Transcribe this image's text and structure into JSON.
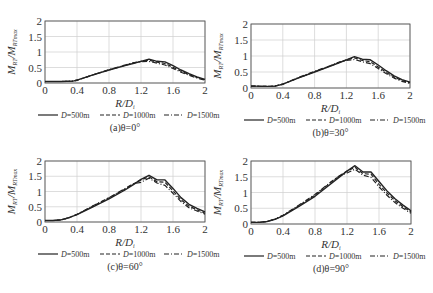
{
  "figure": {
    "x_axis_label_main": "R/D",
    "x_axis_label_sub": "i",
    "y_axis_label_main": "M",
    "y_axis_label_sub1": "RT",
    "y_axis_label_mid": "/M",
    "y_axis_label_sub2": "RTmax",
    "legend": [
      {
        "label": "D=500m",
        "style": "solid"
      },
      {
        "label": "D=1000m",
        "style": "dashed"
      },
      {
        "label": "D=1500m",
        "style": "dashdot"
      }
    ]
  },
  "chart_data": [
    {
      "type": "line",
      "title": "(a)θ=0°",
      "xlabel": "R/Di",
      "ylabel": "MRT/MRTmax",
      "xlim": [
        0,
        2
      ],
      "ylim": [
        0,
        2
      ],
      "xticks": [
        "0",
        "0.4",
        "0.8",
        "1.2",
        "1.6",
        "2"
      ],
      "yticks": [
        "0",
        "0.5",
        "1",
        "1.5",
        "2"
      ],
      "grid": true,
      "legend_position": "bottom",
      "x": [
        0,
        0.2,
        0.35,
        0.4,
        0.6,
        0.8,
        1.0,
        1.1,
        1.2,
        1.3,
        1.4,
        1.5,
        1.6,
        1.7,
        1.8,
        1.9,
        2.0
      ],
      "series": [
        {
          "name": "D=500m",
          "values": [
            0.05,
            0.05,
            0.06,
            0.09,
            0.26,
            0.42,
            0.56,
            0.63,
            0.7,
            0.77,
            0.7,
            0.68,
            0.56,
            0.42,
            0.3,
            0.2,
            0.12
          ]
        },
        {
          "name": "D=1000m",
          "values": [
            0.05,
            0.05,
            0.06,
            0.09,
            0.26,
            0.42,
            0.57,
            0.64,
            0.7,
            0.74,
            0.67,
            0.63,
            0.51,
            0.38,
            0.27,
            0.18,
            0.1
          ]
        },
        {
          "name": "D=1500m",
          "values": [
            0.05,
            0.05,
            0.06,
            0.09,
            0.26,
            0.43,
            0.58,
            0.65,
            0.69,
            0.7,
            0.64,
            0.58,
            0.47,
            0.35,
            0.25,
            0.16,
            0.09
          ]
        }
      ]
    },
    {
      "type": "line",
      "title": "(b)θ=30°",
      "xlabel": "R/Di",
      "ylabel": "MRT/MRTmax",
      "xlim": [
        0,
        2
      ],
      "ylim": [
        0,
        2
      ],
      "xticks": [
        "0",
        "0.4",
        "0.8",
        "1.2",
        "1.6",
        "2"
      ],
      "yticks": [
        "0",
        "0.5",
        "1",
        "1.5",
        "2"
      ],
      "grid": true,
      "legend_position": "bottom",
      "x": [
        0,
        0.2,
        0.3,
        0.4,
        0.6,
        0.8,
        1.0,
        1.1,
        1.2,
        1.3,
        1.4,
        1.5,
        1.6,
        1.7,
        1.8,
        1.9,
        2.0
      ],
      "series": [
        {
          "name": "D=500m",
          "values": [
            0.06,
            0.05,
            0.06,
            0.12,
            0.32,
            0.5,
            0.68,
            0.78,
            0.88,
            0.98,
            0.9,
            0.88,
            0.72,
            0.54,
            0.38,
            0.26,
            0.18
          ]
        },
        {
          "name": "D=1000m",
          "values": [
            0.06,
            0.05,
            0.06,
            0.12,
            0.32,
            0.51,
            0.69,
            0.79,
            0.88,
            0.94,
            0.86,
            0.82,
            0.66,
            0.49,
            0.34,
            0.23,
            0.16
          ]
        },
        {
          "name": "D=1500m",
          "values": [
            0.06,
            0.05,
            0.06,
            0.12,
            0.33,
            0.52,
            0.7,
            0.8,
            0.86,
            0.89,
            0.82,
            0.76,
            0.61,
            0.45,
            0.31,
            0.21,
            0.14
          ]
        }
      ]
    },
    {
      "type": "line",
      "title": "(c)θ=60°",
      "xlabel": "R/Di",
      "ylabel": "MRT/MRTmax",
      "xlim": [
        0,
        2
      ],
      "ylim": [
        0,
        2
      ],
      "xticks": [
        "0",
        "0.4",
        "0.8",
        "1.2",
        "1.6",
        "2"
      ],
      "yticks": [
        "0",
        "0.5",
        "1",
        "1.5",
        "2"
      ],
      "grid": true,
      "legend_position": "bottom",
      "x": [
        0,
        0.1,
        0.2,
        0.3,
        0.4,
        0.6,
        0.8,
        1.0,
        1.1,
        1.2,
        1.3,
        1.4,
        1.5,
        1.6,
        1.7,
        1.8,
        1.9,
        2.0
      ],
      "series": [
        {
          "name": "D=500m",
          "values": [
            0.05,
            0.05,
            0.07,
            0.14,
            0.24,
            0.5,
            0.76,
            1.05,
            1.22,
            1.4,
            1.53,
            1.38,
            1.38,
            1.1,
            0.8,
            0.58,
            0.45,
            0.33
          ]
        },
        {
          "name": "D=1000m",
          "values": [
            0.05,
            0.05,
            0.07,
            0.14,
            0.25,
            0.52,
            0.79,
            1.08,
            1.24,
            1.38,
            1.48,
            1.32,
            1.3,
            1.02,
            0.73,
            0.52,
            0.4,
            0.29
          ]
        },
        {
          "name": "D=1500m",
          "values": [
            0.05,
            0.05,
            0.07,
            0.14,
            0.25,
            0.53,
            0.8,
            1.1,
            1.25,
            1.3,
            1.44,
            1.28,
            1.2,
            0.94,
            0.67,
            0.47,
            0.36,
            0.26
          ]
        }
      ]
    },
    {
      "type": "line",
      "title": "(d)θ=90°",
      "xlabel": "R/Di",
      "ylabel": "MRT/MRTmax",
      "xlim": [
        0,
        2
      ],
      "ylim": [
        0,
        2
      ],
      "xticks": [
        "0",
        "0.4",
        "0.8",
        "1.2",
        "1.6",
        "2"
      ],
      "yticks": [
        "0",
        "0.5",
        "1",
        "1.5",
        "2"
      ],
      "grid": true,
      "legend_position": "bottom",
      "x": [
        0,
        0.1,
        0.2,
        0.3,
        0.4,
        0.6,
        0.8,
        1.0,
        1.1,
        1.2,
        1.3,
        1.4,
        1.5,
        1.6,
        1.7,
        1.8,
        1.9,
        2.0
      ],
      "series": [
        {
          "name": "D=500m",
          "values": [
            0.05,
            0.05,
            0.08,
            0.15,
            0.26,
            0.56,
            0.88,
            1.28,
            1.48,
            1.68,
            1.85,
            1.65,
            1.65,
            1.35,
            1.05,
            0.8,
            0.6,
            0.42
          ]
        },
        {
          "name": "D=1000m",
          "values": [
            0.05,
            0.05,
            0.08,
            0.15,
            0.27,
            0.58,
            0.92,
            1.32,
            1.52,
            1.68,
            1.8,
            1.6,
            1.58,
            1.26,
            0.98,
            0.74,
            0.55,
            0.38
          ]
        },
        {
          "name": "D=1500m",
          "values": [
            0.05,
            0.05,
            0.08,
            0.16,
            0.28,
            0.6,
            0.94,
            1.34,
            1.52,
            1.62,
            1.74,
            1.55,
            1.48,
            1.18,
            0.91,
            0.68,
            0.5,
            0.34
          ]
        }
      ]
    }
  ],
  "panels_layout": [
    {
      "left": 45,
      "top": 21,
      "width": 160,
      "height": 62
    },
    {
      "left": 251,
      "top": 24,
      "width": 159,
      "height": 64
    },
    {
      "left": 45,
      "top": 161,
      "width": 160,
      "height": 61
    },
    {
      "left": 251,
      "top": 161,
      "width": 160,
      "height": 63
    }
  ]
}
